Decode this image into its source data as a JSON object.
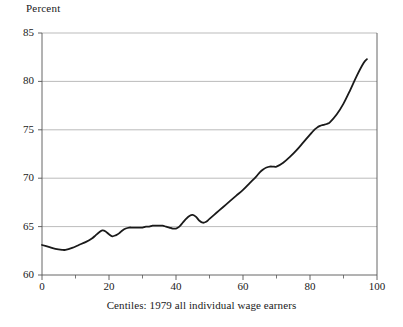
{
  "chart_data": {
    "type": "line",
    "title": "",
    "ylabel": "Percent",
    "xlabel": "Centiles: 1979 all individual wage earners",
    "xlim": [
      0,
      100
    ],
    "ylim": [
      60,
      85
    ],
    "xticks": [
      0,
      20,
      40,
      60,
      80,
      100
    ],
    "xtick_labels": [
      "0",
      "20",
      "40",
      "60",
      "80",
      "100"
    ],
    "yticks": [
      60,
      65,
      70,
      75,
      80,
      85
    ],
    "ytick_labels": [
      "60",
      "65",
      "70",
      "75",
      "80",
      "85"
    ],
    "minor_xticks": [
      10,
      30,
      50,
      70,
      90
    ],
    "grid": "horizontal",
    "legend": null,
    "line_color": "#1a1a1a",
    "line_width": 1.8,
    "grid_color": "#aaaaaa",
    "axis_color": "#555555",
    "series": [
      {
        "name": "Percent",
        "x": [
          0,
          2,
          4,
          6,
          7,
          9,
          11,
          13,
          15,
          16,
          17,
          18,
          19,
          20,
          21,
          22,
          23,
          24,
          25,
          26,
          27,
          28,
          29,
          30,
          31,
          32,
          33,
          34,
          35,
          36,
          37,
          38,
          39,
          40,
          41,
          42,
          43,
          44,
          45,
          46,
          47,
          48,
          49,
          50,
          52,
          54,
          56,
          58,
          60,
          62,
          64,
          65,
          66,
          67,
          68,
          69,
          70,
          72,
          74,
          76,
          78,
          80,
          81,
          82,
          83,
          84,
          85,
          86,
          88,
          90,
          92,
          94,
          96,
          97
        ],
        "y": [
          63.1,
          62.9,
          62.7,
          62.6,
          62.6,
          62.8,
          63.1,
          63.4,
          63.8,
          64.1,
          64.4,
          64.6,
          64.5,
          64.2,
          64.0,
          64.1,
          64.3,
          64.6,
          64.8,
          64.9,
          64.9,
          64.9,
          64.9,
          64.9,
          65.0,
          65.0,
          65.1,
          65.1,
          65.1,
          65.1,
          65.0,
          64.9,
          64.8,
          64.8,
          65.0,
          65.4,
          65.8,
          66.1,
          66.2,
          66.0,
          65.6,
          65.4,
          65.5,
          65.8,
          66.4,
          67.0,
          67.6,
          68.2,
          68.8,
          69.5,
          70.2,
          70.6,
          70.9,
          71.1,
          71.2,
          71.2,
          71.2,
          71.6,
          72.2,
          72.9,
          73.7,
          74.5,
          74.9,
          75.2,
          75.4,
          75.5,
          75.6,
          75.8,
          76.6,
          77.7,
          79.1,
          80.6,
          81.9,
          82.3
        ]
      }
    ]
  }
}
